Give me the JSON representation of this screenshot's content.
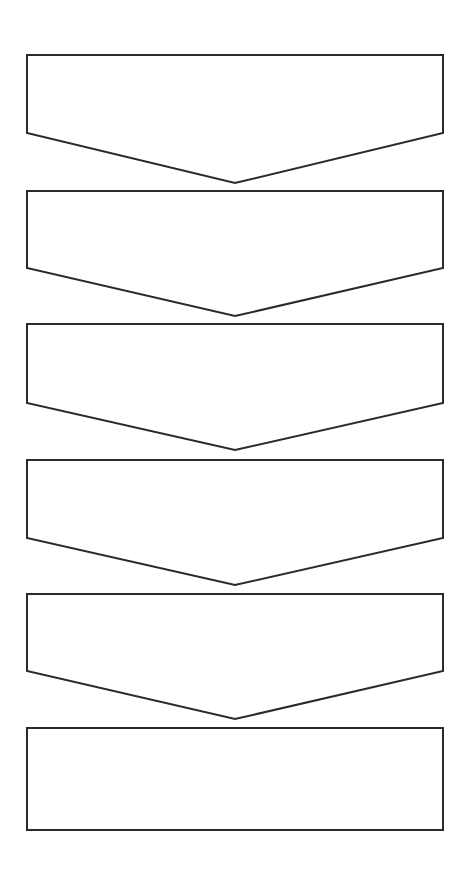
{
  "page": {
    "background_color": "#ffffff",
    "width": 472,
    "height": 878
  },
  "style": {
    "stroke_color": "#2a2a2a",
    "stroke_width": 2,
    "fill_color": "#ffffff"
  },
  "diagram": {
    "type": "stacked-chevron-blocks",
    "shape_count": 6,
    "left_x": 27,
    "right_x": 443,
    "center_x": 235,
    "shapes": [
      {
        "index": 1,
        "name": "chevron-block-1",
        "kind": "chevron",
        "label": "",
        "top_y": 55,
        "shoulder_y": 133,
        "point_y": 183,
        "points": "27,55 443,55 443,133 235,183 27,133"
      },
      {
        "index": 2,
        "name": "chevron-block-2",
        "kind": "chevron",
        "label": "",
        "top_y": 191,
        "shoulder_y": 268,
        "point_y": 316,
        "points": "27,191 443,191 443,268 235,316 27,268"
      },
      {
        "index": 3,
        "name": "chevron-block-3",
        "kind": "chevron",
        "label": "",
        "top_y": 324,
        "shoulder_y": 403,
        "point_y": 450,
        "points": "27,324 443,324 443,403 235,450 27,403"
      },
      {
        "index": 4,
        "name": "chevron-block-4",
        "kind": "chevron",
        "label": "",
        "top_y": 460,
        "shoulder_y": 538,
        "point_y": 585,
        "points": "27,460 443,460 443,538 235,585 27,538"
      },
      {
        "index": 5,
        "name": "chevron-block-5",
        "kind": "chevron",
        "label": "",
        "top_y": 594,
        "shoulder_y": 671,
        "point_y": 719,
        "points": "27,594 443,594 443,671 235,719 27,671"
      },
      {
        "index": 6,
        "name": "rectangle-block-6",
        "kind": "rectangle",
        "label": "",
        "top_y": 728,
        "shoulder_y": 830,
        "point_y": 830,
        "points": "27,728 443,728 443,830 27,830"
      }
    ]
  }
}
